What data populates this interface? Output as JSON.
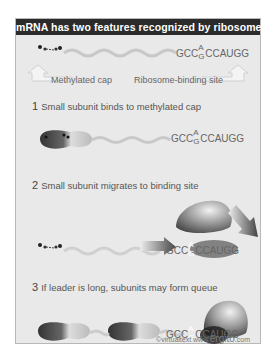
{
  "title": "mRNA has two features recognized by ribosomes",
  "sequence": {
    "prefix": "GCC",
    "stack_top": "A",
    "stack_bottom": "G",
    "suffix": "CCAUGG"
  },
  "labels": {
    "cap": "Methylated cap",
    "binding_site": "Ribosome-binding site"
  },
  "steps": [
    {
      "number": "1",
      "text": "Small subunit  binds to methylated cap"
    },
    {
      "number": "2",
      "text": "Small subunit  migrates to binding site"
    },
    {
      "number": "3",
      "text": "If leader is long, subunits may form queue"
    }
  ],
  "credit": {
    "prefix": "©virtualtext www.",
    "brand": "ergito",
    "suffix": ".com"
  },
  "colors": {
    "header_bg": "#2b2b2b",
    "panel_bg": "#e9e9e9",
    "text": "#666666"
  }
}
